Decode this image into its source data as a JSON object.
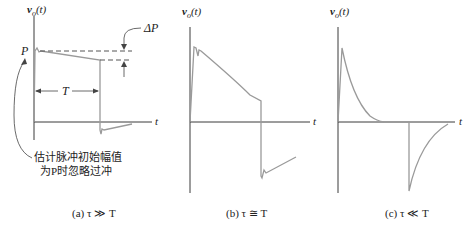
{
  "panels": [
    {
      "id": "a",
      "y_label_v": "v",
      "y_label_sub": "o",
      "y_label_arg": "(t)",
      "x_label": "t",
      "p_label": "P",
      "delta_p_label": "ΔP",
      "period_label": "T",
      "annotation_line1": "估计脉冲初始幅值",
      "annotation_line2": "为P时忽略过冲",
      "caption": "(a) τ ≫ T"
    },
    {
      "id": "b",
      "y_label_v": "v",
      "y_label_sub": "o",
      "y_label_arg": "(t)",
      "x_label": "t",
      "caption": "(b) τ ≅ T"
    },
    {
      "id": "c",
      "y_label_v": "v",
      "y_label_sub": "o",
      "y_label_arg": "(t)",
      "x_label": "t",
      "caption": "(c) τ ≪ T"
    }
  ],
  "colors": {
    "axis": "#3a3a3a",
    "waveform": "#9a9a9a"
  }
}
